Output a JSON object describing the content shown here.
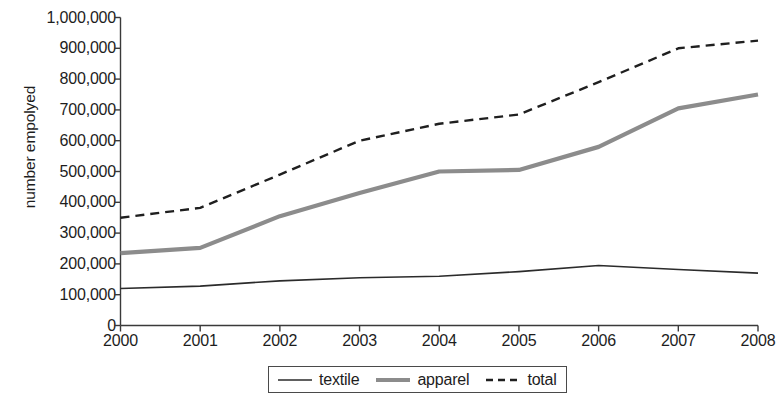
{
  "chart_data": {
    "type": "line",
    "title": "",
    "subtitle": "",
    "xlabel": "",
    "ylabel": "number empolyed",
    "categories": [
      "2000",
      "2001",
      "2002",
      "2003",
      "2004",
      "2005",
      "2006",
      "2007",
      "2008"
    ],
    "x": [
      2000,
      2001,
      2002,
      2003,
      2004,
      2005,
      2006,
      2007,
      2008
    ],
    "xlim": [
      2000,
      2008
    ],
    "ylim": [
      0,
      1000000
    ],
    "y_ticks": [
      0,
      100000,
      200000,
      300000,
      400000,
      500000,
      600000,
      700000,
      800000,
      900000,
      1000000
    ],
    "y_tick_labels": [
      "0",
      "100,000",
      "200,000",
      "300,000",
      "400,000",
      "500,000",
      "600,000",
      "700,000",
      "800,000",
      "900,000",
      "1,000,000"
    ],
    "grid": false,
    "legend_position": "bottom",
    "series": [
      {
        "name": "textile",
        "style": "solid",
        "color": "#2b2b2b",
        "width": 1.6,
        "values": [
          120000,
          128000,
          145000,
          155000,
          160000,
          175000,
          195000,
          182000,
          170000
        ]
      },
      {
        "name": "apparel",
        "style": "solid",
        "color": "#8c8c8c",
        "width": 4.2,
        "values": [
          235000,
          252000,
          355000,
          430000,
          500000,
          505000,
          580000,
          705000,
          750000
        ]
      },
      {
        "name": "total",
        "style": "dashed",
        "color": "#1f1f1f",
        "width": 2.4,
        "values": [
          350000,
          382000,
          490000,
          600000,
          655000,
          685000,
          790000,
          900000,
          925000
        ]
      }
    ]
  },
  "legend": {
    "entries": [
      {
        "label": "textile"
      },
      {
        "label": "apparel"
      },
      {
        "label": "total"
      }
    ]
  },
  "axis": {
    "color": "#3a3a3a"
  }
}
